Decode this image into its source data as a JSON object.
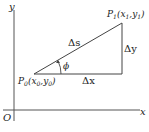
{
  "diagram": {
    "type": "geometry",
    "axes": {
      "x_label": "x",
      "y_label": "y",
      "origin_label": "O"
    },
    "points": {
      "p0": {
        "name": "P",
        "sub": "0",
        "coords": "(x",
        "coords_sub0": "0",
        "sep": ",y",
        "coords_sub1": "0",
        "close": ")"
      },
      "p1": {
        "name": "P",
        "sub": "1",
        "coords": "(x",
        "coords_sub0": "1",
        "sep": ",y",
        "coords_sub1": "1",
        "close": ")"
      }
    },
    "segments": {
      "hypotenuse": "Δs",
      "vertical": "Δy",
      "horizontal": "Δx"
    },
    "angle": "ϕ",
    "colors": {
      "line": "#444444",
      "text": "#222222",
      "background": "#ffffff"
    }
  }
}
